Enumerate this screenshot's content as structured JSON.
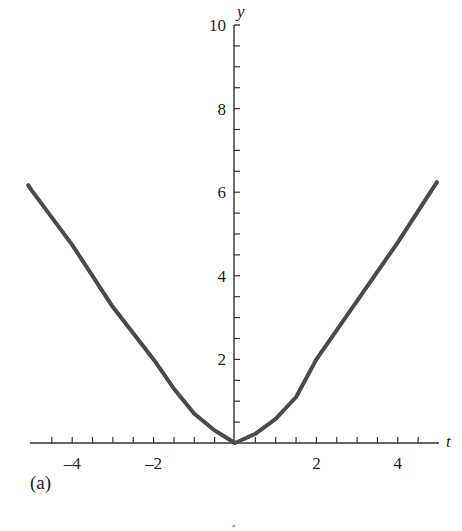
{
  "chart_data": {
    "type": "line",
    "title": "",
    "xlabel": "t",
    "ylabel": "y",
    "panel_label": "(a)",
    "xlim": [
      -5.1,
      5.1
    ],
    "ylim": [
      0,
      10
    ],
    "grid": false,
    "legend": null,
    "x_ticks": {
      "labeled": [
        -4,
        -2,
        2,
        4
      ],
      "minor_step": 0.5
    },
    "y_ticks": {
      "labeled": [
        2,
        4,
        6,
        8,
        10
      ],
      "minor_step": 0.5
    },
    "series": [
      {
        "name": "y(t)",
        "color": "#4a4a4a",
        "x": [
          -5.08,
          -5,
          -4,
          -3,
          -2,
          -1.5,
          -1,
          -0.5,
          0,
          0.5,
          1,
          1.5,
          2,
          3,
          4,
          4.96
        ],
        "y": [
          6.17,
          6.05,
          4.74,
          3.25,
          2.0,
          1.3,
          0.7,
          0.3,
          0,
          0.22,
          0.58,
          1.1,
          2.0,
          3.4,
          4.8,
          6.24
        ]
      }
    ]
  },
  "labels": {
    "x_axis": "t",
    "y_axis": "y",
    "panel": "(a)",
    "stray": "′′"
  },
  "colors": {
    "curve": "#4a4a4a",
    "axis": "#333333",
    "text": "#222222"
  }
}
